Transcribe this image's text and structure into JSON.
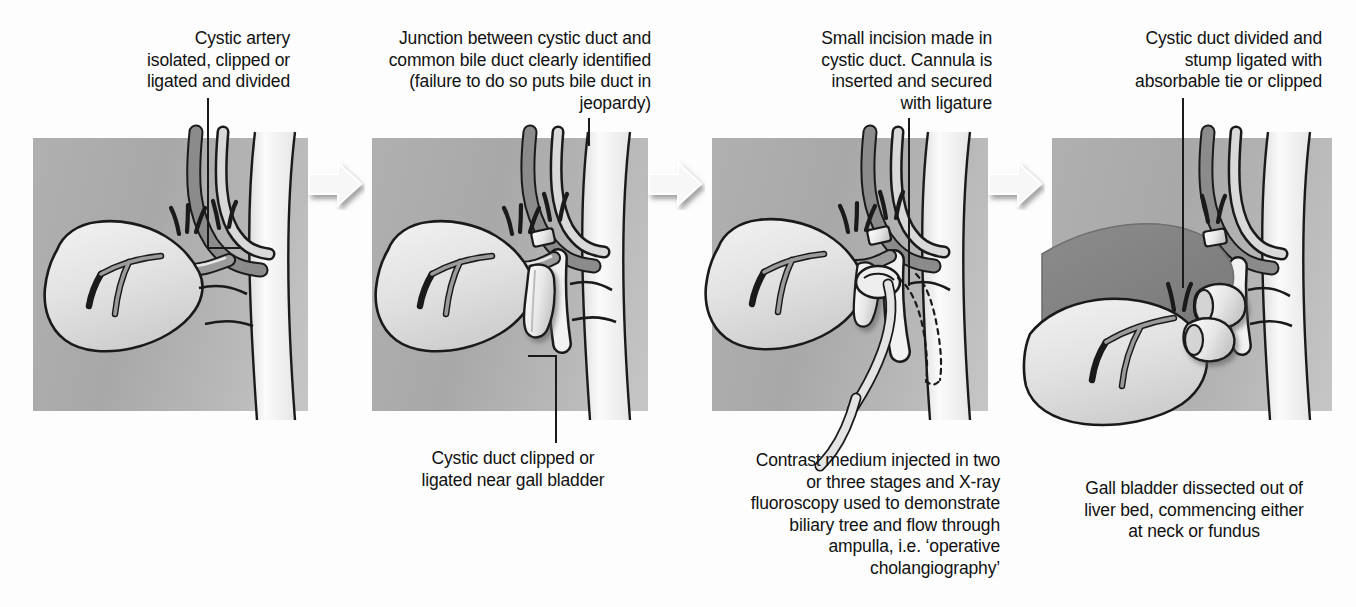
{
  "figure": {
    "step_count": 4,
    "background_color": "#ffffff",
    "panel_color": "#b4b4b4",
    "ink_color": "#1a1a1a"
  },
  "steps": [
    {
      "index": 1,
      "top_caption": "Cystic artery\nisolated, clipped or\nligated and divided",
      "bottom_caption": "",
      "structures": [
        "liver",
        "gall bladder",
        "cystic artery",
        "cystic duct",
        "common bile duct",
        "common hepatic duct",
        "duodenum"
      ]
    },
    {
      "index": 2,
      "top_caption": "Junction between cystic duct and\ncommon bile duct clearly identified\n(failure to do so puts bile duct in\njeopardy)",
      "bottom_caption": "Cystic duct clipped or\nligated near gall bladder",
      "structures": [
        "gall bladder",
        "cystic duct clip",
        "cystic artery clip",
        "common bile duct"
      ]
    },
    {
      "index": 3,
      "top_caption": "Small incision made in\ncystic duct. Cannula is\ninserted and secured\nwith ligature",
      "bottom_caption": "Contrast medium injected in two\nor three stages and X-ray\nfluoroscopy used to demonstrate\nbiliary tree and flow through\nampulla, i.e. ‘operative\ncholangiography’",
      "structures": [
        "cannula",
        "ligature",
        "contrast flow",
        "common bile duct"
      ]
    },
    {
      "index": 4,
      "top_caption": "Cystic duct divided and\nstump ligated with\nabsorbable tie or clipped",
      "bottom_caption": "Gall bladder dissected out of\nliver bed, commencing either\nat neck or fundus",
      "structures": [
        "gall bladder retracted",
        "cystic duct stump clip",
        "cystic artery clip",
        "liver bed"
      ]
    }
  ],
  "arrows": [
    {
      "index": 1,
      "label": "step-1-to-2"
    },
    {
      "index": 2,
      "label": "step-2-to-3"
    },
    {
      "index": 3,
      "label": "step-3-to-4"
    }
  ]
}
